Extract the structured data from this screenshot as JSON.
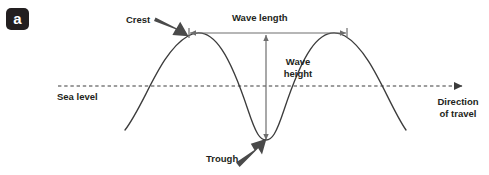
{
  "figure": {
    "panel_label": "a",
    "type": "wave-anatomy-diagram"
  },
  "labels": {
    "crest": "Crest",
    "wave_length": "Wave length",
    "wave_height_line1": "Wave",
    "wave_height_line2": "height",
    "sea_level": "Sea level",
    "direction_line1": "Direction",
    "direction_line2": "of travel",
    "trough": "Trough"
  },
  "colors": {
    "ink": "#231f20",
    "badge_bg": "#231f20",
    "badge_text": "#ffffff",
    "curve": "#3c3c3c",
    "dimension_arrow": "#6e6e6e",
    "pointer_arrow": "#4a4a4a",
    "sea_level_line": "#3c3c3c",
    "background": "#ffffff"
  },
  "geometry": {
    "canvas": {
      "width": 489,
      "height": 175
    },
    "sea_level_y": 86,
    "sea_level_x_start": 58,
    "sea_level_x_end": 470,
    "crest_y": 36,
    "trough_y": 140,
    "crest_1_x": 188,
    "trough_x": 266,
    "crest_2_x": 345,
    "wave_start": {
      "x": 125,
      "y": 130
    },
    "wave_end": {
      "x": 406,
      "y": 130
    },
    "wavelength_arrow": {
      "y": 33,
      "x1": 189,
      "x2": 347
    },
    "waveheight_arrow": {
      "x": 266,
      "y1": 34,
      "y2": 141
    },
    "crest_pointer": {
      "x1": 157,
      "y1": 20,
      "x2": 187,
      "y2": 35
    },
    "trough_pointer": {
      "x1": 238,
      "y1": 161,
      "x2": 264,
      "y2": 140
    }
  }
}
